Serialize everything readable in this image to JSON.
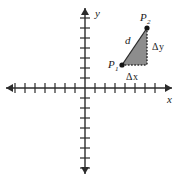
{
  "figure": {
    "type": "coordinate-plane-distance-diagram",
    "width": 178,
    "height": 181,
    "background_color": "#ffffff",
    "axis_color": "#2b2b2b",
    "triangle_fill_color": "#8d8d8d",
    "label_color": "#1a1a1a"
  },
  "axes": {
    "origin": {
      "x": 85,
      "y": 88
    },
    "tick_spacing": 10,
    "x_axis": {
      "label": "x",
      "label_position": {
        "x": 167,
        "y": 103
      },
      "start_x": 6,
      "end_x": 172,
      "ticks_left_of_origin": 7,
      "ticks_right_of_origin": 7,
      "tick_half_length": 5,
      "arrow_left": true,
      "arrow_right": true
    },
    "y_axis": {
      "label": "y",
      "label_position": {
        "x": 95,
        "y": 17
      },
      "start_y": 8,
      "end_y": 174,
      "ticks_above_origin": 7,
      "ticks_below_origin": 8,
      "tick_half_length": 5,
      "arrow_up": true,
      "arrow_down": true
    }
  },
  "triangle": {
    "vertices": {
      "p1": {
        "x": 122,
        "y": 65
      },
      "p2": {
        "x": 147,
        "y": 28
      },
      "right_angle": {
        "x": 147,
        "y": 65
      }
    },
    "hypotenuse_style": "solid",
    "leg_vertical_style": "dotted",
    "leg_horizontal_style": "dotted"
  },
  "labels": {
    "p1": {
      "base": "P",
      "sub": "1",
      "x": 108,
      "y": 68
    },
    "p2": {
      "base": "P",
      "sub": "2",
      "x": 140,
      "y": 21
    },
    "d": {
      "text": "d",
      "x": 125,
      "y": 44
    },
    "delta_y": {
      "delta": "Δ",
      "var": "y",
      "x": 152,
      "y": 50
    },
    "delta_x": {
      "delta": "Δ",
      "var": "x",
      "x": 126,
      "y": 80
    }
  }
}
